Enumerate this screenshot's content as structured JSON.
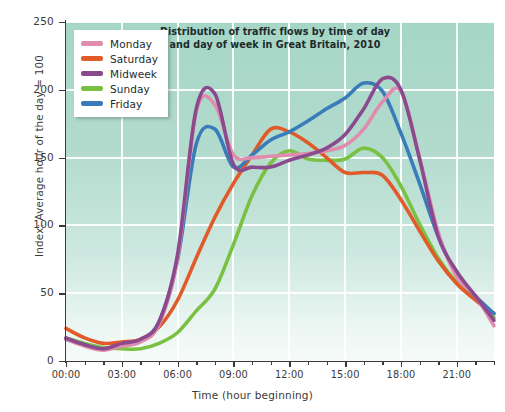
{
  "chart_data": {
    "type": "line",
    "title": "Distribution of traffic flows by time of day and day of week in Great Britain, 2010",
    "title_line1": "Distribution of traffic flows by time of day",
    "title_line2": "and day of week in Great Britain, 2010",
    "xlabel": "Time (hour beginning)",
    "ylabel": "Index: Average hour of the day = 100",
    "xlim": [
      0,
      23
    ],
    "ylim": [
      0,
      250
    ],
    "grid": true,
    "legend_position": "top-left",
    "x": [
      0,
      1,
      2,
      3,
      4,
      5,
      6,
      7,
      8,
      9,
      10,
      11,
      12,
      13,
      14,
      15,
      16,
      17,
      18,
      19,
      20,
      21,
      22,
      23
    ],
    "categories": [
      "00:00",
      "01:00",
      "02:00",
      "03:00",
      "04:00",
      "05:00",
      "06:00",
      "07:00",
      "08:00",
      "09:00",
      "10:00",
      "11:00",
      "12:00",
      "13:00",
      "14:00",
      "15:00",
      "16:00",
      "17:00",
      "18:00",
      "19:00",
      "20:00",
      "21:00",
      "22:00",
      "23:00"
    ],
    "xticks": [
      0,
      3,
      6,
      9,
      12,
      15,
      18,
      21
    ],
    "xticklabels": [
      "00:00",
      "03:00",
      "06:00",
      "09:00",
      "12:00",
      "15:00",
      "18:00",
      "21:00"
    ],
    "yticks": [
      0,
      50,
      100,
      150,
      200,
      250
    ],
    "yticklabels": [
      "0",
      "50",
      "100",
      "150",
      "200",
      "250"
    ],
    "series": [
      {
        "name": "Monday",
        "color": "#e08cae",
        "values": [
          16,
          11,
          8,
          11,
          14,
          27,
          76,
          184,
          189,
          152,
          150,
          151,
          152,
          153,
          155,
          159,
          171,
          191,
          199,
          150,
          95,
          62,
          48,
          26
        ]
      },
      {
        "name": "Saturday",
        "color": "#e15a29",
        "values": [
          24,
          17,
          13,
          14,
          16,
          25,
          45,
          76,
          106,
          131,
          152,
          171,
          169,
          161,
          150,
          139,
          139,
          137,
          119,
          96,
          74,
          57,
          45,
          35
        ]
      },
      {
        "name": "Midweek",
        "color": "#8c4a8e",
        "values": [
          17,
          12,
          9,
          13,
          16,
          29,
          79,
          186,
          197,
          145,
          143,
          143,
          148,
          152,
          157,
          167,
          186,
          208,
          200,
          149,
          92,
          66,
          48,
          30
        ]
      },
      {
        "name": "Sunday",
        "color": "#7ac143",
        "values": [
          17,
          13,
          10,
          9,
          9,
          13,
          21,
          37,
          53,
          86,
          122,
          146,
          155,
          149,
          148,
          149,
          157,
          150,
          129,
          101,
          76,
          58,
          46,
          32
        ]
      },
      {
        "name": "Friday",
        "color": "#3a7cb9",
        "values": [
          16,
          12,
          9,
          12,
          15,
          29,
          75,
          160,
          171,
          143,
          152,
          163,
          169,
          177,
          186,
          194,
          205,
          199,
          168,
          131,
          92,
          64,
          48,
          35
        ]
      }
    ]
  },
  "legend": {
    "items": [
      {
        "label": "Monday",
        "color": "#e08cae"
      },
      {
        "label": "Saturday",
        "color": "#e15a29"
      },
      {
        "label": "Midweek",
        "color": "#8c4a8e"
      },
      {
        "label": "Sunday",
        "color": "#7ac143"
      },
      {
        "label": "Friday",
        "color": "#3a7cb9"
      }
    ]
  },
  "colors": {
    "background": "#ffffff",
    "plot_background_top": "#a5d6c6",
    "plot_background_bottom": "#f6fbf9",
    "gridline": "#ffffff",
    "axis": "#3a3a38",
    "text": "#3a3a38",
    "title_text": "#1d2b2b"
  }
}
